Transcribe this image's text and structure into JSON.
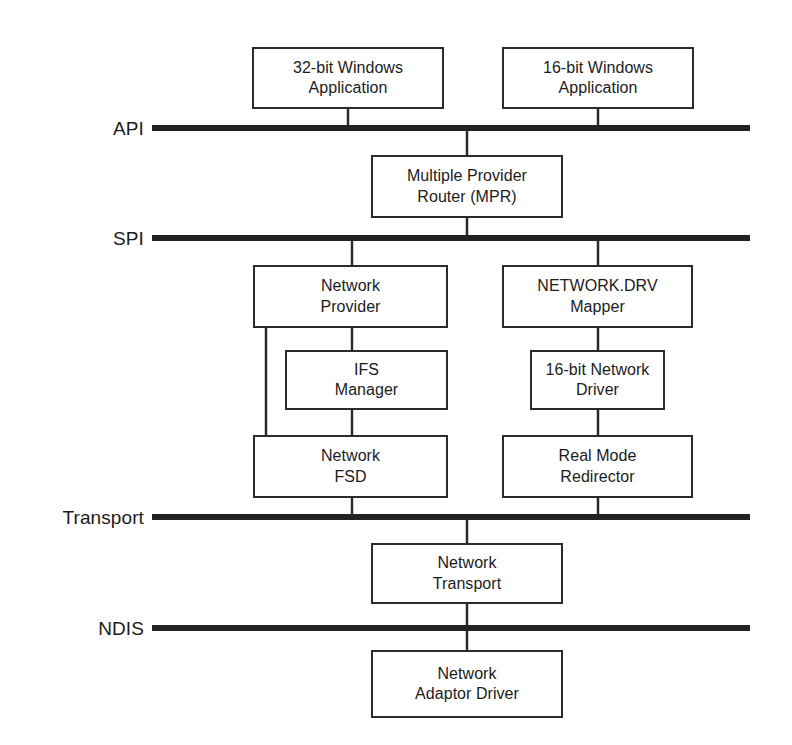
{
  "diagram": {
    "canvas": {
      "width": 792,
      "height": 745
    },
    "colors": {
      "background": "#ffffff",
      "stroke": "#2b2b2b",
      "rule": "#222222",
      "text": "#1c1c1c"
    },
    "layer_rules": [
      {
        "id": "api",
        "label": "API",
        "label_x": 144,
        "y": 128,
        "x1": 152,
        "x2": 750,
        "thickness": 6
      },
      {
        "id": "spi",
        "label": "SPI",
        "label_x": 144,
        "y": 238,
        "x1": 152,
        "x2": 750,
        "thickness": 6
      },
      {
        "id": "transport",
        "label": "Transport",
        "label_x": 144,
        "y": 517,
        "x1": 152,
        "x2": 750,
        "thickness": 6
      },
      {
        "id": "ndis",
        "label": "NDIS",
        "label_x": 144,
        "y": 628,
        "x1": 152,
        "x2": 750,
        "thickness": 6
      }
    ],
    "boxes": [
      {
        "id": "app32",
        "lines": [
          "32-bit Windows",
          "Application"
        ],
        "x": 252,
        "y": 47,
        "w": 192,
        "h": 62
      },
      {
        "id": "app16",
        "lines": [
          "16-bit Windows",
          "Application"
        ],
        "x": 502,
        "y": 47,
        "w": 192,
        "h": 62
      },
      {
        "id": "mpr",
        "lines": [
          "Multiple Provider",
          "Router (MPR)"
        ],
        "x": 371,
        "y": 155,
        "w": 192,
        "h": 63
      },
      {
        "id": "network-provider",
        "lines": [
          "Network",
          "Provider"
        ],
        "x": 253,
        "y": 265,
        "w": 195,
        "h": 63
      },
      {
        "id": "netdrv-mapper",
        "lines": [
          "NETWORK.DRV",
          "Mapper"
        ],
        "x": 502,
        "y": 265,
        "w": 191,
        "h": 63
      },
      {
        "id": "ifs-manager",
        "lines": [
          "IFS",
          "Manager"
        ],
        "x": 285,
        "y": 350,
        "w": 163,
        "h": 60
      },
      {
        "id": "net-driver-16",
        "lines": [
          "16-bit Network",
          "Driver"
        ],
        "x": 530,
        "y": 350,
        "w": 135,
        "h": 60
      },
      {
        "id": "network-fsd",
        "lines": [
          "Network",
          "FSD"
        ],
        "x": 253,
        "y": 435,
        "w": 195,
        "h": 63
      },
      {
        "id": "real-mode-redir",
        "lines": [
          "Real Mode",
          "Redirector"
        ],
        "x": 502,
        "y": 435,
        "w": 191,
        "h": 63
      },
      {
        "id": "network-transport",
        "lines": [
          "Network",
          "Transport"
        ],
        "x": 371,
        "y": 543,
        "w": 192,
        "h": 61
      },
      {
        "id": "network-adaptor",
        "lines": [
          "Network",
          "Adaptor Driver"
        ],
        "x": 371,
        "y": 650,
        "w": 192,
        "h": 68
      }
    ],
    "connectors": [
      {
        "id": "app32-to-api",
        "x1": 348,
        "y1": 109,
        "x2": 348,
        "y2": 128
      },
      {
        "id": "app16-to-api",
        "x1": 598,
        "y1": 109,
        "x2": 598,
        "y2": 128
      },
      {
        "id": "api-to-mpr",
        "x1": 467,
        "y1": 128,
        "x2": 467,
        "y2": 155
      },
      {
        "id": "mpr-to-spi",
        "x1": 467,
        "y1": 218,
        "x2": 467,
        "y2": 238
      },
      {
        "id": "spi-to-network-provider",
        "x1": 352,
        "y1": 238,
        "x2": 352,
        "y2": 265
      },
      {
        "id": "spi-to-netdrv-mapper",
        "x1": 598,
        "y1": 238,
        "x2": 598,
        "y2": 265
      },
      {
        "id": "provider-to-ifs",
        "x1": 352,
        "y1": 328,
        "x2": 352,
        "y2": 350
      },
      {
        "id": "provider-bypass-left",
        "x1": 266,
        "y1": 328,
        "x2": 266,
        "y2": 435
      },
      {
        "id": "ifs-to-fsd",
        "x1": 352,
        "y1": 410,
        "x2": 352,
        "y2": 435
      },
      {
        "id": "mapper-to-driver16",
        "x1": 598,
        "y1": 328,
        "x2": 598,
        "y2": 350
      },
      {
        "id": "driver16-to-redirector",
        "x1": 598,
        "y1": 410,
        "x2": 598,
        "y2": 435
      },
      {
        "id": "fsd-to-transport",
        "x1": 352,
        "y1": 498,
        "x2": 352,
        "y2": 517
      },
      {
        "id": "redirector-to-transport",
        "x1": 598,
        "y1": 498,
        "x2": 598,
        "y2": 517
      },
      {
        "id": "transport-to-nettransport",
        "x1": 467,
        "y1": 517,
        "x2": 467,
        "y2": 543
      },
      {
        "id": "nettransport-to-ndis",
        "x1": 467,
        "y1": 604,
        "x2": 467,
        "y2": 628
      },
      {
        "id": "ndis-to-adaptor",
        "x1": 467,
        "y1": 628,
        "x2": 467,
        "y2": 650
      }
    ]
  }
}
